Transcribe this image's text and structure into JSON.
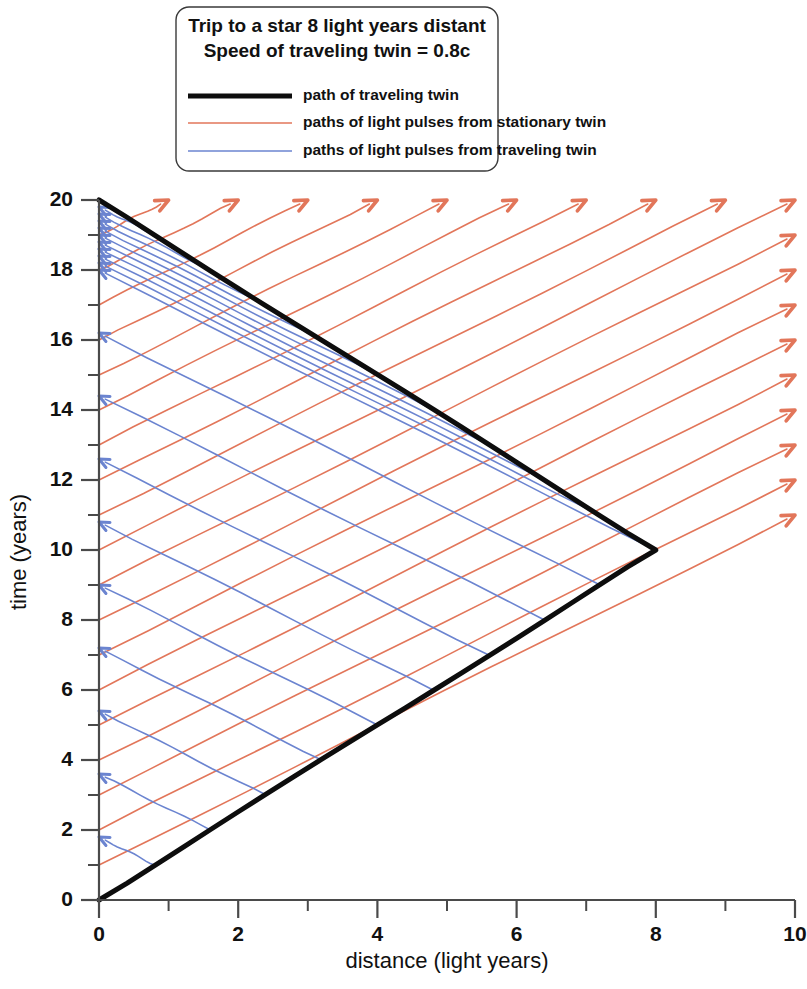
{
  "chart_data": {
    "type": "line",
    "title": "Trip to a star 8 light years distant",
    "subtitle": "Speed of traveling twin = 0.8c",
    "xlabel": "distance (light years)",
    "ylabel": "time (years)",
    "xlim": [
      0,
      10
    ],
    "ylim": [
      0,
      20
    ],
    "x_major_ticks": [
      0,
      2,
      4,
      6,
      8,
      10
    ],
    "x_minor_ticks": [
      1,
      3,
      5,
      7,
      9
    ],
    "y_major_ticks": [
      0,
      2,
      4,
      6,
      8,
      10,
      12,
      14,
      16,
      18,
      20
    ],
    "y_minor_ticks": [
      1,
      3,
      5,
      7,
      9,
      11,
      13,
      15,
      17,
      19
    ],
    "x_tick_labels": [
      "0",
      "2",
      "4",
      "6",
      "8",
      "10"
    ],
    "y_tick_labels": [
      "0",
      "2",
      "4",
      "6",
      "8",
      "10",
      "12",
      "14",
      "16",
      "18",
      "20"
    ],
    "grid": false,
    "legend_position": "top-center",
    "star_distance_ly": 8,
    "traveling_twin_speed_c": 0.8,
    "stationary_twin_total_years": 20,
    "turnaround_event": [
      8,
      10
    ],
    "series": [
      {
        "name": "path of traveling twin",
        "color": "#0d0d0d",
        "width": 5.0,
        "kind": "worldline",
        "points": [
          [
            0,
            0
          ],
          [
            8,
            10
          ],
          [
            0,
            20
          ]
        ]
      },
      {
        "name": "paths of light pulses from stationary twin",
        "color": "#e2765a",
        "width": 1.6,
        "kind": "light-rays-right",
        "slope": 1,
        "origin_x": 0,
        "emission_times": [
          1,
          2,
          3,
          4,
          5,
          6,
          7,
          8,
          9,
          10,
          11,
          12,
          13,
          14,
          15,
          16,
          17,
          18,
          19,
          20
        ],
        "arrow": "end"
      },
      {
        "name": "paths of light pulses from traveling twin",
        "color": "#6b84d0",
        "width": 1.6,
        "kind": "light-rays-left",
        "slope": -1,
        "target_x": 0,
        "emission_events_outbound": [
          [
            0.8,
            1
          ],
          [
            1.6,
            2
          ],
          [
            2.4,
            3
          ],
          [
            3.2,
            4
          ],
          [
            4.0,
            5
          ],
          [
            4.8,
            6
          ],
          [
            5.6,
            7
          ],
          [
            6.4,
            8
          ],
          [
            7.2,
            9
          ],
          [
            8.0,
            10
          ]
        ],
        "emission_events_inbound": [
          [
            7.2,
            11
          ],
          [
            6.4,
            12
          ],
          [
            5.6,
            13
          ],
          [
            4.8,
            14
          ],
          [
            4.0,
            15
          ],
          [
            3.2,
            16
          ],
          [
            2.4,
            17
          ],
          [
            1.6,
            18
          ],
          [
            0.8,
            19
          ]
        ],
        "reception_times_outbound": [
          1.8,
          3.6,
          5.4,
          7.2,
          9.0,
          10.8,
          12.6,
          14.4,
          16.2,
          18.0
        ],
        "reception_times_inbound": [
          18.2,
          18.4,
          18.6,
          18.8,
          19.0,
          19.2,
          19.4,
          19.6,
          19.8
        ],
        "arrow": "end"
      }
    ]
  },
  "legend": {
    "title_line1": "Trip to a star 8 light years distant",
    "title_line2": "Speed of traveling twin = 0.8c",
    "entries": [
      {
        "label": "path of traveling twin",
        "color": "#0d0d0d",
        "width": 5.0
      },
      {
        "label": "paths of light pulses from stationary twin",
        "color": "#e2765a",
        "width": 1.6
      },
      {
        "label": "paths of light pulses from traveling twin",
        "color": "#6b84d0",
        "width": 1.6
      }
    ]
  },
  "axes": {
    "x_title": "distance (light years)",
    "y_title": "time (years)"
  },
  "colors": {
    "traveling_twin": "#0d0d0d",
    "stationary_pulses": "#e2765a",
    "traveling_pulses": "#6b84d0",
    "axis": "#4a4a4a",
    "background": "#ffffff"
  }
}
